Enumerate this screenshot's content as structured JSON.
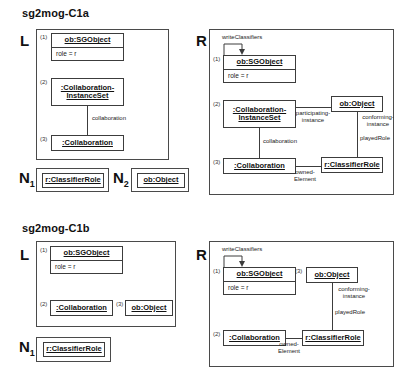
{
  "diagrams": [
    {
      "title": "sg2mog-C1a",
      "panels": {
        "left_letter": "L",
        "right_letter": "R",
        "n1_letter": "N",
        "n1_sub": "1",
        "n2_letter": "N",
        "n2_sub": "2"
      },
      "lhs": {
        "nodes": [
          {
            "index": "(1)",
            "name": "ob:SGObject",
            "attribute": "role = r"
          },
          {
            "index": "(2)",
            "name": "Collaboration-InstanceSet",
            "name_line1": ":Collaboration-",
            "name_line2": "InstanceSet"
          },
          {
            "index": "(3)",
            "name": ":Collaboration"
          }
        ],
        "edges": [
          {
            "label": "collaboration"
          }
        ]
      },
      "rhs": {
        "loop_label": "writeClassifiers",
        "nodes": [
          {
            "index": "(1)",
            "name": "ob:SGObject",
            "attribute": "role = r"
          },
          {
            "index": "(2)",
            "name_line1": ":Collaboration-",
            "name_line2": "InstanceSet"
          },
          {
            "index": "(3)",
            "name": ":Collaboration"
          },
          {
            "name": "ob:Object"
          },
          {
            "name": "r:ClassifierRole"
          }
        ],
        "edges": [
          {
            "label_line1": "participating-",
            "label_line2": "instance"
          },
          {
            "label_line1": "conforming-",
            "label_line2": "instance"
          },
          {
            "label": "playedRole"
          },
          {
            "label": "collaboration"
          },
          {
            "label_line1": "owned-",
            "label_line2": "Element"
          }
        ]
      },
      "n1": {
        "name": "r:ClassifierRole"
      },
      "n2": {
        "name": "ob:Object"
      }
    },
    {
      "title": "sg2mog-C1b",
      "panels": {
        "left_letter": "L",
        "right_letter": "R",
        "n1_letter": "N",
        "n1_sub": "1"
      },
      "lhs": {
        "nodes": [
          {
            "index": "(1)",
            "name": "ob:SGObject",
            "attribute": "role = r"
          },
          {
            "index": "(2)",
            "name": ":Collaboration"
          },
          {
            "index": "(3)",
            "name": "ob:Object"
          }
        ]
      },
      "rhs": {
        "loop_label": "writeClassifiers",
        "nodes": [
          {
            "index": "(1)",
            "name": "ob:SGObject",
            "attribute": "role = r"
          },
          {
            "index": "(2)",
            "name": ":Collaboration"
          },
          {
            "index": "(3)",
            "name": "ob:Object"
          },
          {
            "name": "r:ClassifierRole"
          }
        ],
        "edges": [
          {
            "label_line1": "conforming-",
            "label_line2": "instance"
          },
          {
            "label": "playedRole"
          },
          {
            "label_line1": "owned-",
            "label_line2": "Element"
          }
        ]
      },
      "n1": {
        "name": "r:ClassifierRole"
      }
    }
  ],
  "colors": {
    "stroke": "#3c3c3c",
    "panel_stroke": "#4a4a4a",
    "background": "#ffffff",
    "text": "#111111"
  }
}
